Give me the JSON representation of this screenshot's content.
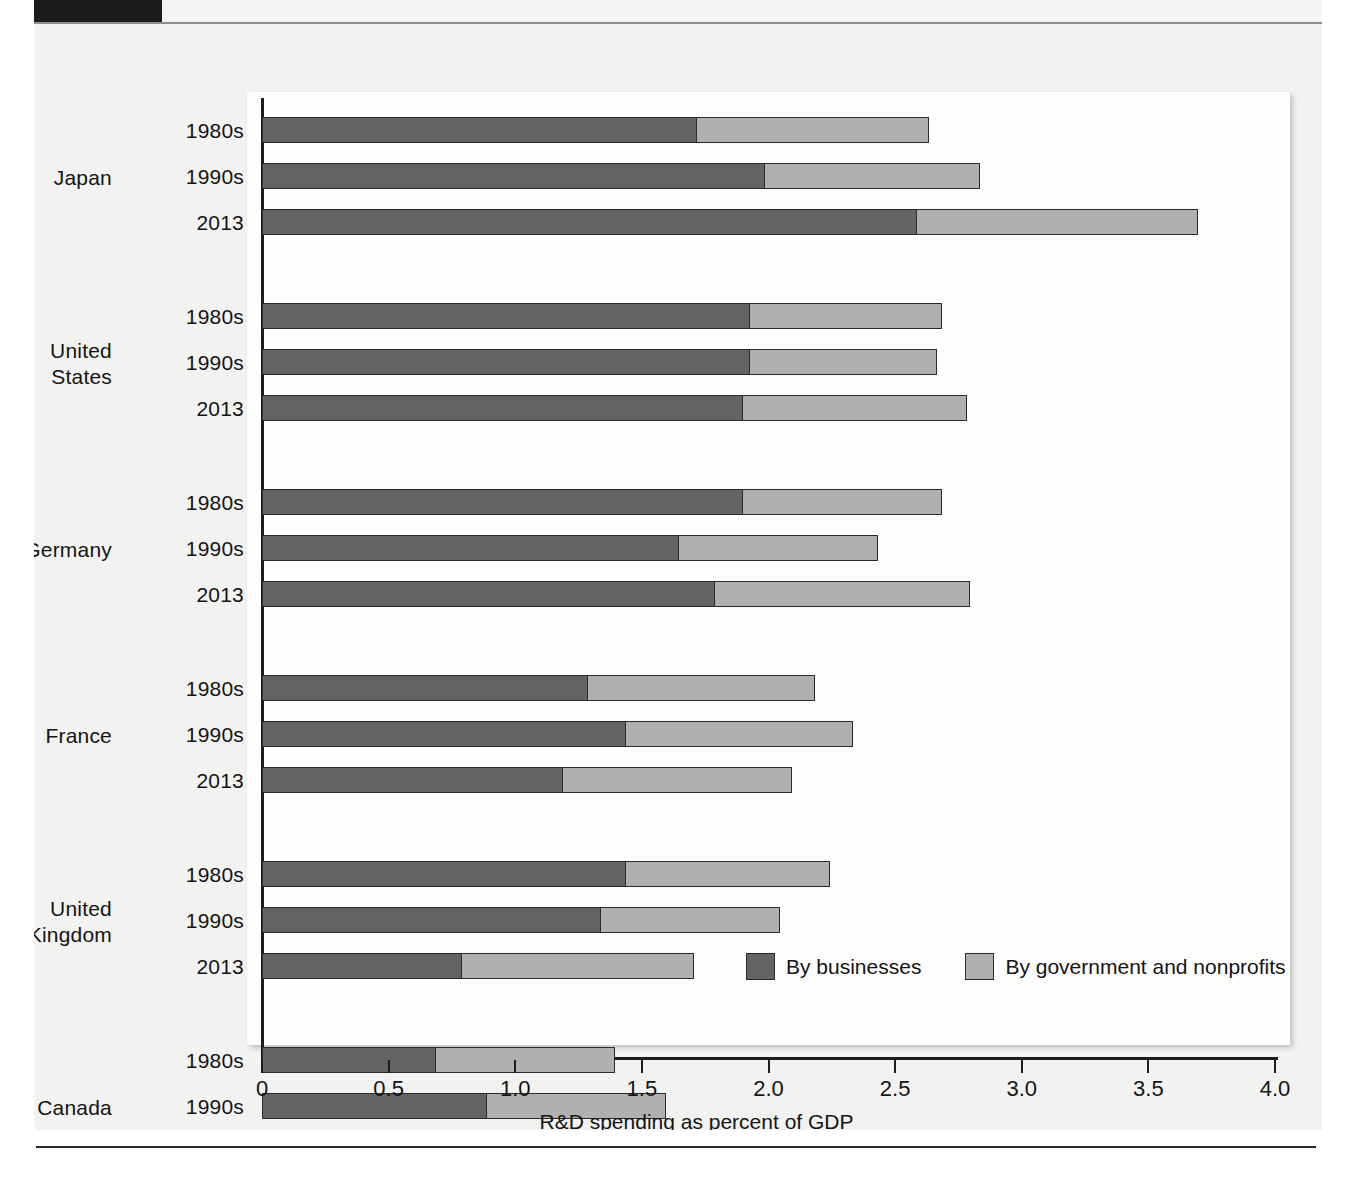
{
  "chart_data": {
    "type": "bar",
    "orientation": "horizontal",
    "stacked": true,
    "title": "",
    "xlabel": "R&D spending as percent of GDP",
    "ylabel": "",
    "xlim": [
      0,
      4.0
    ],
    "xticks": [
      "0",
      "0.5",
      "1.0",
      "1.5",
      "2.0",
      "2.5",
      "3.0",
      "3.5",
      "4.0"
    ],
    "xtick_values": [
      0,
      0.5,
      1.0,
      1.5,
      2.0,
      2.5,
      3.0,
      3.5,
      4.0
    ],
    "grid": false,
    "legend_position": "inside-bottom-right",
    "series": [
      {
        "name": "By businesses",
        "color": "#646464"
      },
      {
        "name": "By government and nonprofits",
        "color": "#b0b0b0"
      }
    ],
    "groups": [
      {
        "country": "Japan",
        "rows": [
          {
            "period": "1980s",
            "businesses": 1.72,
            "government": 0.92,
            "total": 2.64
          },
          {
            "period": "1990s",
            "businesses": 1.99,
            "government": 0.85,
            "total": 2.84
          },
          {
            "period": "2013",
            "businesses": 2.59,
            "government": 1.11,
            "total": 3.7
          }
        ]
      },
      {
        "country": "United States",
        "rows": [
          {
            "period": "1980s",
            "businesses": 1.93,
            "government": 0.76,
            "total": 2.69
          },
          {
            "period": "1990s",
            "businesses": 1.93,
            "government": 0.74,
            "total": 2.67
          },
          {
            "period": "2013",
            "businesses": 1.9,
            "government": 0.89,
            "total": 2.79
          }
        ]
      },
      {
        "country": "Germany",
        "rows": [
          {
            "period": "1980s",
            "businesses": 1.9,
            "government": 0.79,
            "total": 2.69
          },
          {
            "period": "1990s",
            "businesses": 1.65,
            "government": 0.79,
            "total": 2.44
          },
          {
            "period": "2013",
            "businesses": 1.79,
            "government": 1.01,
            "total": 2.8
          }
        ]
      },
      {
        "country": "France",
        "rows": [
          {
            "period": "1980s",
            "businesses": 1.29,
            "government": 0.9,
            "total": 2.19
          },
          {
            "period": "1990s",
            "businesses": 1.44,
            "government": 0.9,
            "total": 2.34
          },
          {
            "period": "2013",
            "businesses": 1.19,
            "government": 0.91,
            "total": 2.1
          }
        ]
      },
      {
        "country": "United Kingdom",
        "rows": [
          {
            "period": "1980s",
            "businesses": 1.44,
            "government": 0.81,
            "total": 2.25
          },
          {
            "period": "1990s",
            "businesses": 1.34,
            "government": 0.71,
            "total": 2.05
          },
          {
            "period": "2013",
            "businesses": 0.79,
            "government": 0.92,
            "total": 1.71
          }
        ]
      },
      {
        "country": "Canada",
        "rows": [
          {
            "period": "1980s",
            "businesses": 0.69,
            "government": 0.71,
            "total": 1.4
          },
          {
            "period": "1990s",
            "businesses": 0.89,
            "government": 0.71,
            "total": 1.6
          },
          {
            "period": "2013",
            "businesses": 0.79,
            "government": 0.92,
            "total": 1.71
          }
        ]
      },
      {
        "country": "Italy",
        "rows": [
          {
            "period": "1980s",
            "businesses": 0.63,
            "government": 0.41,
            "total": 1.04
          },
          {
            "period": "1990s",
            "businesses": 0.6,
            "government": 0.5,
            "total": 1.1
          },
          {
            "period": "2013",
            "businesses": 0.5,
            "government": 0.6,
            "total": 1.1
          }
        ]
      }
    ]
  },
  "legend": {
    "businesses_label": "By businesses",
    "government_label": "By government and nonprofits",
    "businesses_color": "#646464",
    "government_color": "#b0b0b0"
  },
  "axis": {
    "x_title": "R&D spending as percent of GDP"
  }
}
